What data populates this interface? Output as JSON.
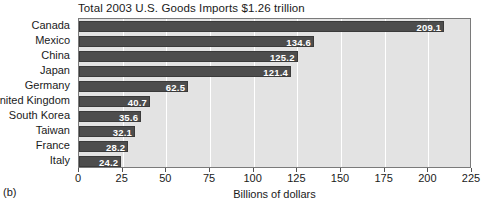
{
  "figure": {
    "caption": "(b)"
  },
  "chart_data": {
    "type": "bar",
    "orientation": "horizontal",
    "title": "Total 2003 U.S. Goods Imports $1.26 trillion",
    "xlabel": "Billions of dollars",
    "ylabel": "",
    "categories": [
      "Canada",
      "Mexico",
      "China",
      "Japan",
      "Germany",
      "United Kingdom",
      "South Korea",
      "Taiwan",
      "France",
      "Italy"
    ],
    "values": [
      209.1,
      134.6,
      125.2,
      121.4,
      62.5,
      40.7,
      35.6,
      32.1,
      28.2,
      24.2
    ],
    "value_labels": [
      "209.1",
      "134.6",
      "125.2",
      "121.4",
      "62.5",
      "40.7",
      "35.6",
      "32.1",
      "28.2",
      "24.2"
    ],
    "xlim": [
      0,
      225
    ],
    "xticks": [
      0,
      25,
      50,
      75,
      100,
      125,
      150,
      175,
      200,
      225
    ],
    "xtick_labels": [
      "0",
      "25",
      "50",
      "75",
      "100",
      "125",
      "150",
      "175",
      "200",
      "225"
    ],
    "grid": true,
    "grid_axis": "x",
    "legend": null,
    "colors": {
      "bar": "#4d4d4d",
      "bar_border": "#3a3a3a",
      "plot_background": "#e3e3e3",
      "gridline": "#ffffff",
      "frame": "#7a7a7a",
      "value_label": "#ffffff",
      "text": "#1a1a1a"
    }
  }
}
